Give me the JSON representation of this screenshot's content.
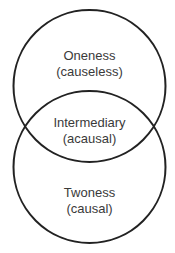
{
  "diagram": {
    "type": "venn",
    "stroke_color": "#222222",
    "text_color": "#3a3a3a",
    "sets": [
      {
        "id": "upper",
        "label": "Oneness",
        "sublabel": "(causeless)"
      },
      {
        "id": "lower",
        "label": "Twoness",
        "sublabel": "(causal)"
      }
    ],
    "intersection": {
      "label": "Intermediary",
      "sublabel": "(acausal)"
    }
  }
}
